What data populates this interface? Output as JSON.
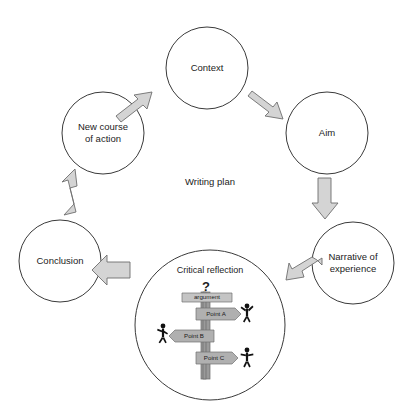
{
  "diagram": {
    "center_label": "Writing plan",
    "cycle_nodes": [
      {
        "id": "context",
        "label": "Context",
        "lines": [
          "Context"
        ]
      },
      {
        "id": "aim",
        "label": "Aim",
        "lines": [
          "Aim"
        ]
      },
      {
        "id": "narrative-of-experience",
        "label": "Narrative of experience",
        "lines": [
          "Narrative of",
          "experience"
        ]
      },
      {
        "id": "critical-reflection",
        "label": "Critical reflection",
        "lines": [
          "Critical reflection"
        ]
      },
      {
        "id": "conclusion",
        "label": "Conclusion",
        "lines": [
          "Conclusion"
        ]
      },
      {
        "id": "new-course-of-action",
        "label": "New course of action",
        "lines": [
          "New course",
          "of action"
        ]
      }
    ],
    "reflection": {
      "title": "Critical reflection",
      "question_mark": "?",
      "signs": [
        {
          "id": "argument",
          "label": "argument",
          "direction": "none"
        },
        {
          "id": "point-a",
          "label": "Point A",
          "direction": "right"
        },
        {
          "id": "point-b",
          "label": "Point B",
          "direction": "left"
        },
        {
          "id": "point-c",
          "label": "Point C",
          "direction": "right"
        }
      ],
      "figures": [
        {
          "id": "figure-point-a",
          "pose": "waving",
          "side": "right"
        },
        {
          "id": "figure-point-b",
          "pose": "walking",
          "side": "left"
        },
        {
          "id": "figure-point-c",
          "pose": "arms-out",
          "side": "right"
        }
      ]
    },
    "arrows": [
      {
        "id": "arrow-new-course-to-context",
        "from": "new-course-of-action",
        "to": "context",
        "direction": "up-right"
      },
      {
        "id": "arrow-context-to-aim",
        "from": "context",
        "to": "aim",
        "direction": "down-right"
      },
      {
        "id": "arrow-aim-to-narrative",
        "from": "aim",
        "to": "narrative-of-experience",
        "direction": "down"
      },
      {
        "id": "arrow-narrative-to-reflection",
        "from": "narrative-of-experience",
        "to": "critical-reflection",
        "direction": "down-left"
      },
      {
        "id": "arrow-reflection-to-conclusion",
        "from": "critical-reflection",
        "to": "conclusion",
        "direction": "left"
      },
      {
        "id": "arrow-conclusion-to-new-course",
        "from": "conclusion",
        "to": "new-course-of-action",
        "direction": "up"
      }
    ],
    "colors": {
      "background": "#ffffff",
      "circle_stroke": "#3a3a3a",
      "arrow_fill": "#d4d4d4",
      "arrow_stroke": "#6e6e6e",
      "sign_fill": "#b0b0b0",
      "post_fill": "#9a9a9a",
      "text": "#1c1c1c"
    }
  }
}
